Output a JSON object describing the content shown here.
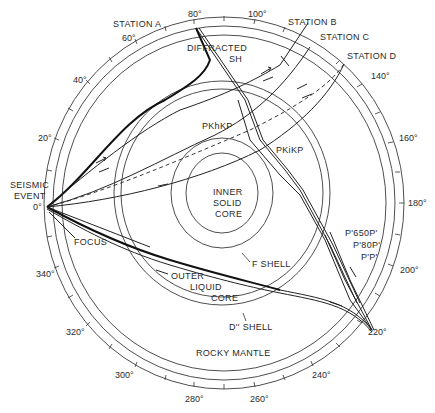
{
  "diagram": {
    "stations": [
      {
        "label": "STATION A"
      },
      {
        "label": "STATION B"
      },
      {
        "label": "STATION C"
      },
      {
        "label": "STATION D"
      }
    ],
    "event_label_line1": "SEISMIC",
    "event_label_line2": "EVENT",
    "origin_degree": "0°",
    "focus_label": "FOCUS",
    "layers": {
      "inner_core_1": "INNER",
      "inner_core_2": "SOLID",
      "inner_core_3": "CORE",
      "outer_core_1": "OUTER",
      "outer_core_2": "LIQUID",
      "outer_core_3": "CORE",
      "f_shell": "F SHELL",
      "d_shell": "D'' SHELL",
      "mantle": "ROCKY MANTLE"
    },
    "phases": {
      "diffracted_1": "DIFFRACTED",
      "diffracted_2": "SH",
      "pkhkp": "PKhKP",
      "pkikp": "PKiKP",
      "p650p": "P'650P'",
      "p80p": "P'80P'",
      "pp": "P'P'"
    },
    "degree_labels": [
      "20°",
      "40°",
      "60°",
      "80°",
      "100°",
      "140°",
      "160°",
      "180°",
      "200°",
      "220°",
      "240°",
      "260°",
      "280°",
      "300°",
      "320°",
      "340°"
    ]
  }
}
